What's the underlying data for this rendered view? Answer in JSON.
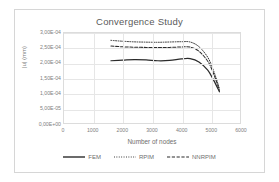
{
  "chart_data": {
    "type": "line",
    "title": "Convergence Study",
    "xlabel": "Number of nodes",
    "ylabel": "|u| (mm)",
    "xlim": [
      0,
      6000
    ],
    "ylim": [
      0,
      0.0003
    ],
    "grid": true,
    "legend_position": "bottom",
    "xticks": [
      0,
      1000,
      2000,
      3000,
      4000,
      5000,
      6000
    ],
    "xtick_labels": [
      "0",
      "1000",
      "2000",
      "3000",
      "4000",
      "5000",
      "6000"
    ],
    "yticks": [
      0,
      5e-05,
      0.0001,
      0.00015,
      0.0002,
      0.00025,
      0.0003
    ],
    "ytick_labels": [
      "0,00E+00",
      "5,00E-05",
      "1,00E-04",
      "1,50E-04",
      "2,00E-04",
      "2,50E-04",
      "3,00E-04"
    ],
    "series": [
      {
        "name": "FEM",
        "style": "solid",
        "color": "#2b2b2b",
        "x": [
          1600,
          2000,
          2400,
          2800,
          3200,
          3600,
          4000,
          4300,
          4600,
          4900,
          5100,
          5300
        ],
        "values": [
          0.0002075,
          0.0002095,
          0.0002115,
          0.0002105,
          0.0002075,
          0.0002085,
          0.0002135,
          0.0002145,
          0.0002035,
          0.000176,
          0.000143,
          0.000104
        ]
      },
      {
        "name": "RPIM",
        "style": "dotted",
        "color": "#2b2b2b",
        "x": [
          1600,
          2000,
          2400,
          2800,
          3200,
          3600,
          4000,
          4300,
          4600,
          4900,
          5100,
          5300
        ],
        "values": [
          0.0002755,
          0.0002725,
          0.0002705,
          0.0002695,
          0.000269,
          0.00027,
          0.000271,
          0.00027,
          0.0002545,
          0.000219,
          0.000174,
          0.000115
        ]
      },
      {
        "name": "NNRPIM",
        "style": "dashed",
        "color": "#2b2b2b",
        "x": [
          1600,
          2000,
          2400,
          2800,
          3200,
          3600,
          4000,
          4300,
          4600,
          4900,
          5100,
          5300
        ],
        "values": [
          0.0002565,
          0.000254,
          0.0002525,
          0.000252,
          0.0002515,
          0.000252,
          0.0002535,
          0.000253,
          0.000239,
          0.000206,
          0.000164,
          0.000109
        ]
      }
    ]
  }
}
